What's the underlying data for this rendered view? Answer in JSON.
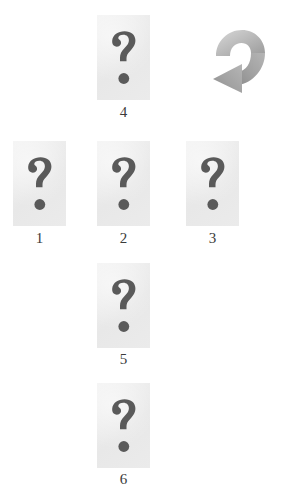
{
  "figure": {
    "type": "cognitive-test-figure",
    "background_color": "#ffffff",
    "tile_color": "#ededed",
    "glyph_color": "#5a5a5a",
    "caption_color": "#3b3b3b",
    "arrow_color": "#a9a9a9"
  },
  "arrow": {
    "name": "clockwise-rotation-arrow",
    "direction": "clockwise",
    "color": "#a9a9a9"
  },
  "tiles": [
    {
      "id": "tile-4",
      "label": "4",
      "glyph": "question-mark",
      "row": "top",
      "x": 97,
      "y": 15,
      "w": 53,
      "h": 85,
      "caption_y": 104
    },
    {
      "id": "tile-1",
      "label": "1",
      "glyph": "question-mark",
      "row": "middle",
      "x": 13,
      "y": 141,
      "w": 53,
      "h": 85,
      "caption_y": 230
    },
    {
      "id": "tile-2",
      "label": "2",
      "glyph": "question-mark",
      "row": "middle",
      "x": 97,
      "y": 141,
      "w": 53,
      "h": 85,
      "caption_y": 230
    },
    {
      "id": "tile-3",
      "label": "3",
      "glyph": "question-mark",
      "row": "middle",
      "x": 186,
      "y": 141,
      "w": 53,
      "h": 85,
      "caption_y": 230
    },
    {
      "id": "tile-5",
      "label": "5",
      "glyph": "question-mark",
      "row": "lower",
      "x": 97,
      "y": 263,
      "w": 53,
      "h": 85,
      "caption_y": 351
    },
    {
      "id": "tile-6",
      "label": "6",
      "glyph": "question-mark",
      "row": "bottom",
      "x": 97,
      "y": 383,
      "w": 53,
      "h": 85,
      "caption_y": 471
    }
  ]
}
